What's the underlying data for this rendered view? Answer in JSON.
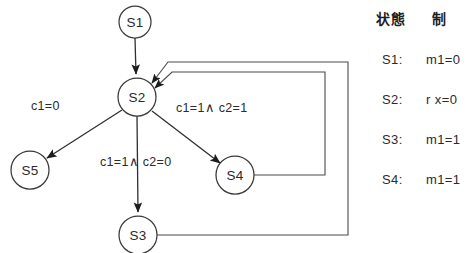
{
  "diagram": {
    "title": "",
    "type": "state-transition-diagram",
    "nodes": [
      {
        "id": "S1",
        "label": "S1",
        "cx": 135,
        "cy": 22,
        "r": 16
      },
      {
        "id": "S2",
        "label": "S2",
        "cx": 137,
        "cy": 97,
        "r": 19
      },
      {
        "id": "S5",
        "label": "S5",
        "cx": 30,
        "cy": 170,
        "r": 19
      },
      {
        "id": "S3",
        "label": "S3",
        "cx": 138,
        "cy": 235,
        "r": 19
      },
      {
        "id": "S4",
        "label": "S4",
        "cx": 235,
        "cy": 175,
        "r": 19
      }
    ],
    "edge_labels": [
      {
        "id": "label-s2-s5",
        "text": "c1=0",
        "x": 31,
        "y": 110
      },
      {
        "id": "label-s2-s4",
        "text": "c1=1∧ c2=1",
        "x": 176,
        "y": 112
      },
      {
        "id": "label-s2-s3",
        "text": "c1=1∧ c2=0",
        "x": 100,
        "y": 166
      }
    ],
    "edges": [
      {
        "from": "S1",
        "to": "S2",
        "label": ""
      },
      {
        "from": "S2",
        "to": "S5",
        "label": "c1=0"
      },
      {
        "from": "S2",
        "to": "S4",
        "label": "c1=1∧ c2=1"
      },
      {
        "from": "S2",
        "to": "S3",
        "label": "c1=1∧ c2=0"
      },
      {
        "from": "S4",
        "to": "S2",
        "label": ""
      },
      {
        "from": "S3",
        "to": "S2",
        "label": ""
      }
    ]
  },
  "legend": {
    "header": {
      "state_column": "状態",
      "control_column": "制"
    },
    "rows": [
      {
        "state": "S1:",
        "value": "m1=0"
      },
      {
        "state": "S2:",
        "value": "r x=0"
      },
      {
        "state": "S3:",
        "value": "m1=1"
      },
      {
        "state": "S4:",
        "value": "m1=1"
      }
    ]
  }
}
